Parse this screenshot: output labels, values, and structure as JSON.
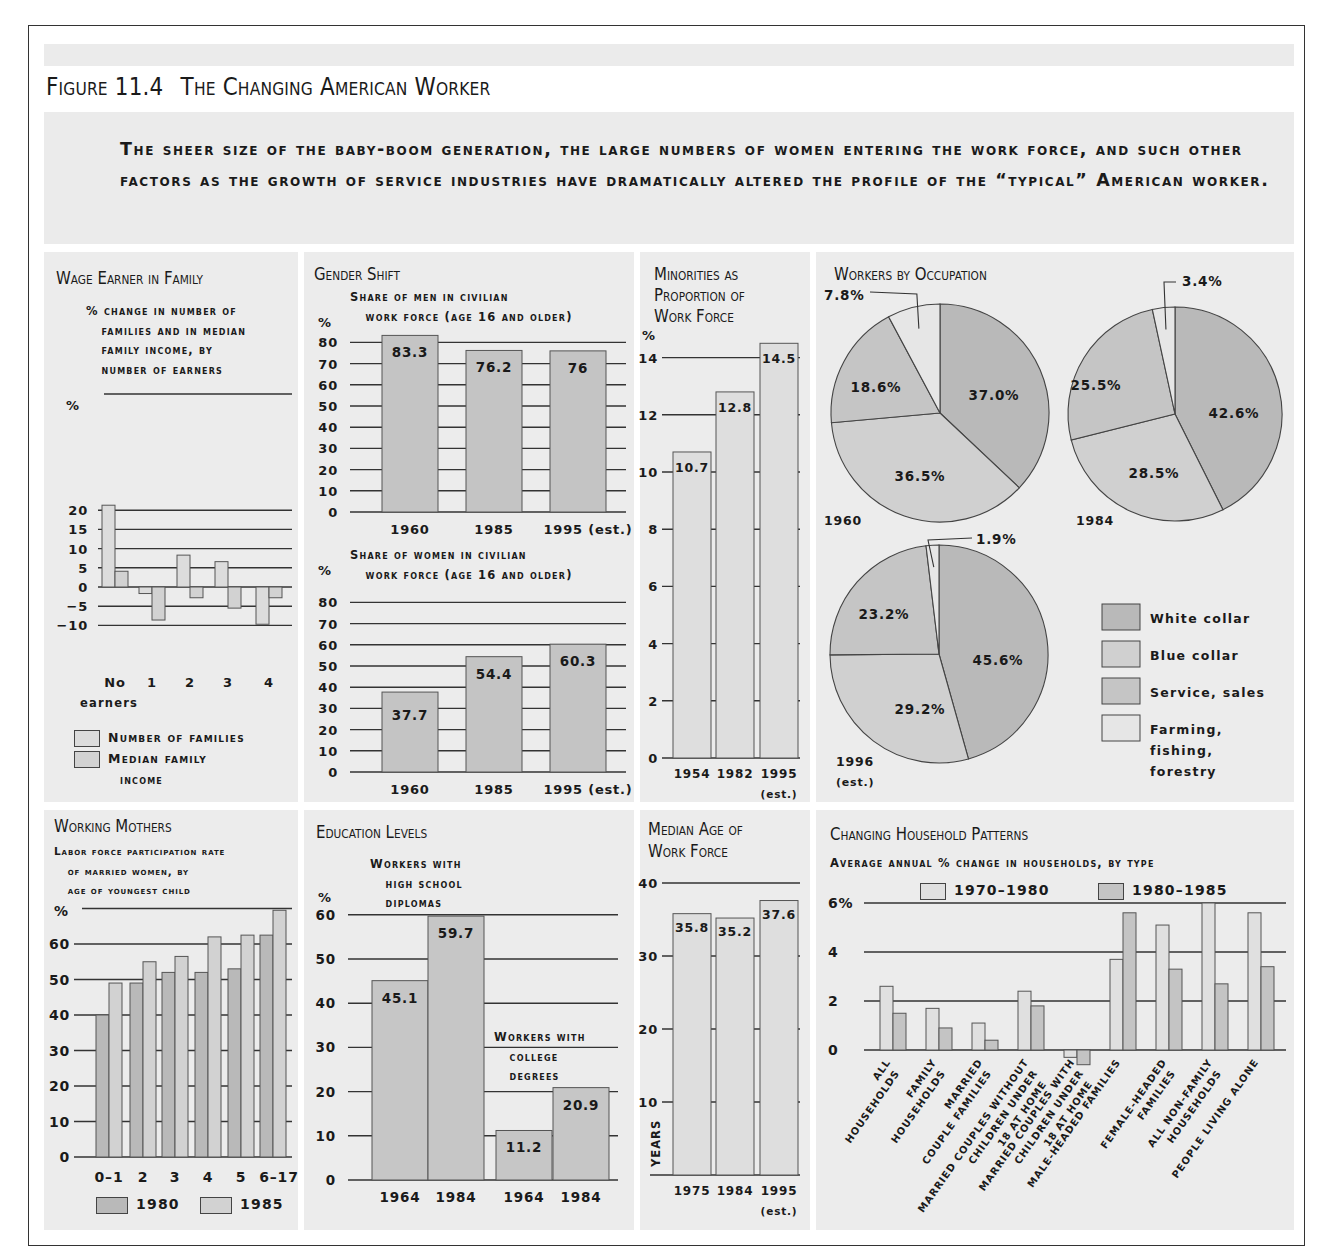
{
  "figure": {
    "number": "Figure 11.4",
    "title": "The Changing American Worker",
    "intro": "The sheer size of the baby-boom generation, the large numbers of women entering the work force, and such other factors as the growth of service industries have dramatically altered the profile of the “typical” American worker."
  },
  "colors": {
    "panel_bg": "#ececec",
    "light_bar": "#dcdcdc",
    "medium_bar": "#c6c6c6",
    "white_collar": "#b9b9b9",
    "blue_collar": "#d0d0d0",
    "service_sales": "#c5c5c5",
    "farming": "#e6e6e6",
    "line": "#333333"
  },
  "chart_data": [
    {
      "id": "wage-earner",
      "type": "bar",
      "title": "Wage Earner in Family",
      "subtitle": "% change in number of\n   families and in median\n   family income, by\n   number of earners",
      "ylabel": "%",
      "ylim": [
        -10,
        25
      ],
      "yticks": [
        20,
        15,
        10,
        5,
        0,
        -5,
        -10
      ],
      "ytick_labels": [
        "20",
        "15",
        "10",
        "5",
        "0",
        "−5",
        "−10"
      ],
      "categories": [
        "No",
        "1",
        "2",
        "3",
        "4"
      ],
      "category_note": "earners",
      "series": [
        {
          "name": "Number of families",
          "values": [
            21.3,
            -1.7,
            8.3,
            6.6,
            -9.7
          ]
        },
        {
          "name": "Median family income",
          "values": [
            4.1,
            -8.6,
            -2.8,
            -5.5,
            -2.8
          ]
        }
      ],
      "legend": [
        "Number of families",
        "Median family",
        "income"
      ],
      "grid": true,
      "legend_placement": "bottom"
    },
    {
      "id": "gender-men",
      "type": "bar",
      "title": "Gender Shift",
      "subtitle": "Share of men in civilian\n   work force (age 16 and older)",
      "ylabel": "%",
      "ylim": [
        0,
        80
      ],
      "yticks": [
        80,
        70,
        60,
        50,
        40,
        30,
        20,
        10,
        0
      ],
      "categories": [
        "1960",
        "1985",
        "1995 (est.)"
      ],
      "values": [
        83.3,
        76.2,
        76
      ],
      "value_labels": [
        "83.3",
        "76.2",
        "76"
      ],
      "grid": true
    },
    {
      "id": "gender-women",
      "type": "bar",
      "subtitle": "Share of women in civilian\n   work force (age 16 and older)",
      "ylabel": "%",
      "ylim": [
        0,
        80
      ],
      "yticks": [
        80,
        70,
        60,
        50,
        40,
        30,
        20,
        10,
        0
      ],
      "categories": [
        "1960",
        "1985",
        "1995 (est.)"
      ],
      "values": [
        37.7,
        54.4,
        60.3
      ],
      "value_labels": [
        "37.7",
        "54.4",
        "60.3"
      ],
      "grid": true
    },
    {
      "id": "minorities",
      "type": "bar",
      "title": "Minorities as Proportion of Work Force",
      "ylabel": "%",
      "ylim": [
        0,
        14
      ],
      "yticks": [
        14,
        12,
        10,
        8,
        6,
        4,
        2,
        0
      ],
      "categories": [
        "1954",
        "1982",
        "1995"
      ],
      "category_note": "(est.)",
      "values": [
        10.7,
        12.8,
        14.5
      ],
      "value_labels": [
        "10.7",
        "12.8",
        "14.5"
      ],
      "grid": true
    },
    {
      "id": "occupation",
      "type": "pie",
      "title": "Workers by Occupation",
      "legend": [
        "White collar",
        "Blue collar",
        "Service, sales",
        "Farming, fishing, forestry"
      ],
      "legend_placement": "bottom-right",
      "pies": [
        {
          "label": "1960",
          "note": "",
          "values": [
            37.0,
            36.5,
            18.6,
            7.8
          ],
          "labels": [
            "37.0%",
            "36.5%",
            "18.6%",
            "7.8%"
          ]
        },
        {
          "label": "1984",
          "note": "",
          "values": [
            42.6,
            28.5,
            25.5,
            3.4
          ],
          "labels": [
            "42.6%",
            "28.5%",
            "25.5%",
            "3.4%"
          ]
        },
        {
          "label": "1996",
          "note": "(est.)",
          "values": [
            45.6,
            29.2,
            23.2,
            1.9
          ],
          "labels": [
            "45.6%",
            "29.2%",
            "23.2%",
            "1.9%"
          ]
        }
      ]
    },
    {
      "id": "working-mothers",
      "type": "bar",
      "title": "Working Mothers",
      "subtitle": "Labor force participation rate\n   of married women, by\n   age of youngest child",
      "ylabel": "%",
      "ylim": [
        0,
        70
      ],
      "yticks": [
        60,
        50,
        40,
        30,
        20,
        10,
        0
      ],
      "categories": [
        "0–1",
        "2",
        "3",
        "4",
        "5",
        "6–17"
      ],
      "series": [
        {
          "name": "1980",
          "values": [
            40,
            49,
            52,
            52,
            53,
            62.5
          ]
        },
        {
          "name": "1985",
          "values": [
            49,
            55,
            56.5,
            62,
            62.5,
            69.5
          ]
        }
      ],
      "grid": true,
      "legend_placement": "bottom"
    },
    {
      "id": "education",
      "type": "bar",
      "title": "Education Levels",
      "ylabel": "%",
      "ylim": [
        0,
        60
      ],
      "yticks": [
        60,
        50,
        40,
        30,
        20,
        10,
        0
      ],
      "groups": [
        {
          "label": "Workers with\n   high school\n   diplomas",
          "categories": [
            "1964",
            "1984"
          ],
          "values": [
            45.1,
            59.7
          ],
          "value_labels": [
            "45.1",
            "59.7"
          ]
        },
        {
          "label": "Workers with\n   college\n   degrees",
          "categories": [
            "1964",
            "1984"
          ],
          "values": [
            11.2,
            20.9
          ],
          "value_labels": [
            "11.2",
            "20.9"
          ]
        }
      ],
      "grid": true
    },
    {
      "id": "median-age",
      "type": "bar",
      "title": "Median Age of Work Force",
      "ylabel": "Years",
      "ylim": [
        0,
        40
      ],
      "yticks": [
        40,
        30,
        20,
        10
      ],
      "categories": [
        "1975",
        "1984",
        "1995"
      ],
      "category_note": "(est.)",
      "values": [
        35.8,
        35.2,
        37.6
      ],
      "value_labels": [
        "35.8",
        "35.2",
        "37.6"
      ],
      "grid": true
    },
    {
      "id": "households",
      "type": "bar",
      "title": "Changing Household Patterns",
      "subtitle": "Average annual % change in households, by type",
      "ylim": [
        -1,
        6
      ],
      "yticks": [
        6,
        4,
        2,
        0
      ],
      "ytick_labels": [
        "6%",
        "4",
        "2",
        "0"
      ],
      "categories": [
        "All\nhouseholds",
        "Family\nhouseholds",
        "Married\ncouple families",
        "Married couples without\nchildren under\n18 at home",
        "Married couples with\nchildren under\n18 at home",
        "Male-headed families",
        "Female-headed\nfamilies",
        "All non-family\nhouseholds",
        "People living alone"
      ],
      "series": [
        {
          "name": "1970–1980",
          "values": [
            2.6,
            1.7,
            1.1,
            2.4,
            -0.3,
            3.7,
            5.1,
            6.0,
            5.6
          ]
        },
        {
          "name": "1980–1985",
          "values": [
            1.5,
            0.9,
            0.4,
            1.8,
            -0.6,
            5.6,
            3.3,
            2.7,
            3.4
          ]
        }
      ],
      "grid": true,
      "legend_placement": "top"
    }
  ]
}
